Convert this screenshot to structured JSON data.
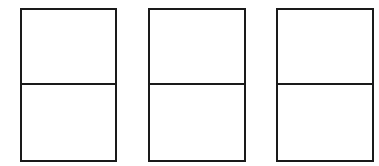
{
  "diagram": {
    "stroke_color": "#1a1a1a",
    "background": "#ffffff",
    "panels": [
      {
        "id": "panel-1",
        "left": 20,
        "width": 97,
        "cells": [
          "top",
          "bottom"
        ]
      },
      {
        "id": "panel-2",
        "left": 148,
        "width": 98,
        "cells": [
          "top",
          "bottom"
        ]
      },
      {
        "id": "panel-3",
        "left": 276,
        "width": 98,
        "cells": [
          "top",
          "bottom"
        ]
      }
    ]
  }
}
